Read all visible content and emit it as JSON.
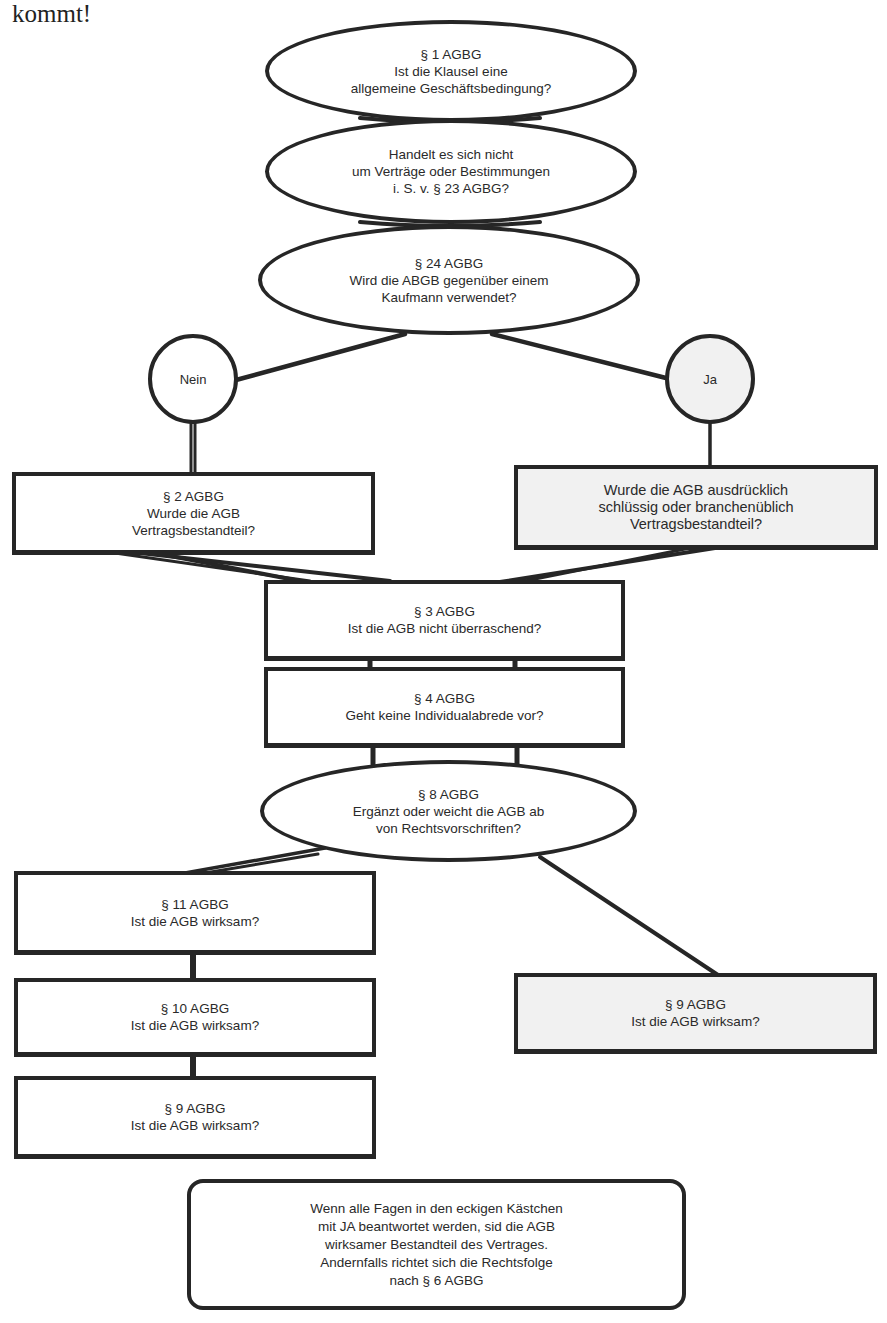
{
  "page": {
    "intro_text": "kommt!"
  },
  "flowchart": {
    "nodes": {
      "q_par1": {
        "shape": "ellipse",
        "text": "§ 1 AGBG\nIst die Klausel eine\nallgemeine Geschäftsbedingung?"
      },
      "q_par23": {
        "shape": "ellipse",
        "text": "Handelt es sich nicht\num Verträge oder Bestimmungen\ni. S. v. § 23 AGBG?"
      },
      "q_par24": {
        "shape": "ellipse",
        "text": "§ 24 AGBG\nWird die ABGB gegenüber einem\nKaufmann verwendet?"
      },
      "answer_nein": {
        "shape": "circle",
        "text": "Nein"
      },
      "answer_ja": {
        "shape": "circle",
        "text": "Ja",
        "fill": "#f1f1f1"
      },
      "q_par2": {
        "shape": "box",
        "text": "§ 2 AGBG\nWurde die AGB\nVertragsbestandteil?"
      },
      "q_kaufmann_einbeziehung": {
        "shape": "box",
        "text": "Wurde die AGB ausdrücklich\nschlüssig oder branchenüblich\nVertragsbestandteil?",
        "fill": "#f1f1f1"
      },
      "q_par3": {
        "shape": "box",
        "text": "§ 3 AGBG\nIst die AGB nicht überraschend?"
      },
      "q_par4": {
        "shape": "box",
        "text": "§ 4 AGBG\nGeht keine Individualabrede vor?"
      },
      "q_par8": {
        "shape": "ellipse",
        "text": "§ 8 AGBG\nErgänzt oder weicht die AGB ab\nvon Rechtsvorschriften?"
      },
      "q_par11": {
        "shape": "box",
        "text": "§ 11 AGBG\nIst die AGB wirksam?"
      },
      "q_par10": {
        "shape": "box",
        "text": "§ 10 AGBG\nIst die AGB wirksam?"
      },
      "q_par9_left": {
        "shape": "box",
        "text": "§ 9 AGBG\nIst die AGB wirksam?"
      },
      "q_par9_right": {
        "shape": "box",
        "text": "§ 9 AGBG\nIst die AGB wirksam?",
        "fill": "#f1f1f1"
      },
      "conclusion": {
        "shape": "rounded-box",
        "text": "Wenn alle Fagen in den eckigen Kästchen\nmit JA beantwortet werden, sid die AGB\nwirksamer Bestandteil des Vertrages.\nAndernfalls richtet sich die Rechtsfolge\nnach § 6 AGBG"
      }
    },
    "edges": [
      [
        "q_par1",
        "q_par23"
      ],
      [
        "q_par23",
        "q_par24"
      ],
      [
        "q_par24",
        "answer_nein"
      ],
      [
        "q_par24",
        "answer_ja"
      ],
      [
        "answer_nein",
        "q_par2"
      ],
      [
        "answer_ja",
        "q_kaufmann_einbeziehung"
      ],
      [
        "q_par2",
        "q_par3"
      ],
      [
        "q_kaufmann_einbeziehung",
        "q_par3"
      ],
      [
        "q_par3",
        "q_par4"
      ],
      [
        "q_par4",
        "q_par8"
      ],
      [
        "q_par8",
        "q_par11"
      ],
      [
        "q_par8",
        "q_par9_right"
      ],
      [
        "q_par11",
        "q_par10"
      ],
      [
        "q_par10",
        "q_par9_left"
      ]
    ],
    "colors": {
      "line": "#262626",
      "shaded_fill": "#f1f1f1",
      "background": "#ffffff"
    }
  }
}
